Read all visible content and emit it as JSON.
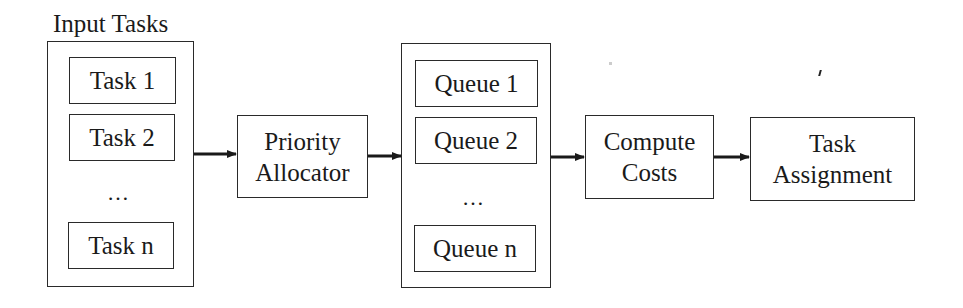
{
  "diagram": {
    "input_group": {
      "title": "Input Tasks",
      "items": [
        "Task 1",
        "Task 2",
        "Task n"
      ],
      "ellipsis": "…"
    },
    "priority_allocator": {
      "line1": "Priority",
      "line2": "Allocator"
    },
    "queue_group": {
      "items": [
        "Queue 1",
        "Queue 2",
        "Queue n"
      ],
      "ellipsis": "…"
    },
    "compute_costs": {
      "line1": "Compute",
      "line2": "Costs"
    },
    "task_assignment": {
      "line1": "Task",
      "line2": "Assignment"
    },
    "edges": [
      {
        "from": "Input Tasks",
        "to": "Priority Allocator"
      },
      {
        "from": "Priority Allocator",
        "to": "Queues"
      },
      {
        "from": "Queues",
        "to": "Compute Costs"
      },
      {
        "from": "Compute Costs",
        "to": "Task Assignment"
      }
    ],
    "colors": {
      "stroke": "#2a2a2a",
      "text": "#1a1a1a",
      "background": "#ffffff"
    }
  }
}
